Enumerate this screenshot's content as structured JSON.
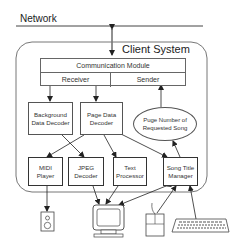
{
  "network": {
    "label": "Network"
  },
  "client_system": {
    "label": "Client System"
  },
  "communication_module": {
    "title": "Communication Module",
    "receiver": "Receiver",
    "sender": "Sender"
  },
  "decoders": {
    "background": {
      "line1": "Background",
      "line2": "Data Decoder"
    },
    "page_data": {
      "line1": "Page Data",
      "line2": "Decoder"
    }
  },
  "request_ellipse": {
    "line1": "Puge Number of",
    "line2": "Requested Song"
  },
  "modules": [
    {
      "line1": "MIDI",
      "line2": "Player"
    },
    {
      "line1": "JPEG",
      "line2": "Decoder"
    },
    {
      "line1": "Text",
      "line2": "Processor"
    },
    {
      "line1": "Song Title",
      "line2": "Manager"
    }
  ],
  "devices": [
    {
      "name": "speaker"
    },
    {
      "name": "monitor"
    },
    {
      "name": "mouse"
    },
    {
      "name": "keyboard"
    }
  ],
  "colors": {
    "line": "#333333",
    "box_border": "#555555",
    "background": "#ffffff"
  }
}
